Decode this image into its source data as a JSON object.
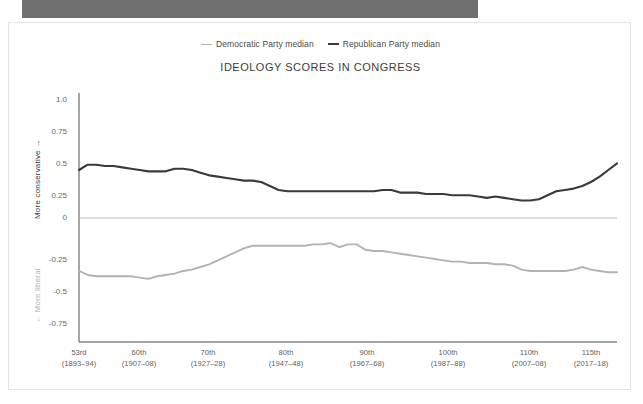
{
  "window": {
    "banner_name": "top-gray-banner"
  },
  "legend": {
    "position": "top-center",
    "items": [
      {
        "label": "Democratic Party median",
        "color": "#b3b3b3",
        "marker": "line-dash-light"
      },
      {
        "label": "Republican Party median",
        "color": "#3a3a3a",
        "marker": "line-dash-dark"
      }
    ]
  },
  "chart_data": {
    "type": "line",
    "title": "IDEOLOGY SCORES IN CONGRESS",
    "xlabel": "",
    "ylabel": "",
    "ylim": [
      -0.875,
      1.0
    ],
    "yticks": [
      "1.0",
      "0.75",
      "0.5",
      "0.25",
      "0",
      "-0.25",
      "-0.5",
      "-0.75"
    ],
    "ytick_values": [
      1.0,
      0.75,
      0.5,
      0.25,
      0,
      -0.25,
      -0.5,
      -0.75
    ],
    "y_axis_top_label": "More conservative →",
    "y_axis_bottom_label": "← More liberal",
    "grid": false,
    "zero_line": true,
    "legend_position": "top-center",
    "xtick_labels": [
      {
        "congress": "53rd",
        "years": "(1893–94)"
      },
      {
        "congress": "60th",
        "years": "(1907–08)"
      },
      {
        "congress": "70th",
        "years": "(1927–28)"
      },
      {
        "congress": "80th",
        "years": "(1947–48)"
      },
      {
        "congress": "90th",
        "years": "(1967–68)"
      },
      {
        "congress": "100th",
        "years": "(1987–88)"
      },
      {
        "congress": "110th",
        "years": "(2007–08)"
      },
      {
        "congress": "115th",
        "years": "(2017–18)"
      }
    ],
    "x": [
      53,
      54,
      55,
      56,
      57,
      58,
      59,
      60,
      61,
      62,
      63,
      64,
      65,
      66,
      67,
      68,
      69,
      70,
      71,
      72,
      73,
      74,
      75,
      76,
      77,
      78,
      79,
      80,
      81,
      82,
      83,
      84,
      85,
      86,
      87,
      88,
      89,
      90,
      91,
      92,
      93,
      94,
      95,
      96,
      97,
      98,
      99,
      100,
      101,
      102,
      103,
      104,
      105,
      106,
      107,
      108,
      109,
      110,
      111,
      112,
      113,
      114,
      115
    ],
    "xlim": [
      53,
      115
    ],
    "series": [
      {
        "name": "Republican Party median",
        "color": "#3a3a3a",
        "values": [
          0.42,
          0.46,
          0.46,
          0.45,
          0.45,
          0.44,
          0.43,
          0.42,
          0.41,
          0.41,
          0.41,
          0.43,
          0.43,
          0.42,
          0.4,
          0.38,
          0.37,
          0.36,
          0.35,
          0.34,
          0.34,
          0.33,
          0.3,
          0.27,
          0.26,
          0.26,
          0.26,
          0.26,
          0.26,
          0.26,
          0.26,
          0.26,
          0.26,
          0.26,
          0.26,
          0.27,
          0.27,
          0.25,
          0.25,
          0.25,
          0.24,
          0.24,
          0.24,
          0.23,
          0.23,
          0.23,
          0.22,
          0.21,
          0.22,
          0.21,
          0.2,
          0.19,
          0.19,
          0.2,
          0.23,
          0.26,
          0.27,
          0.28,
          0.3,
          0.33,
          0.37,
          0.42,
          0.47
        ]
      },
      {
        "name": "Democratic Party median",
        "color": "#b3b3b3",
        "values": [
          -0.34,
          -0.37,
          -0.38,
          -0.38,
          -0.38,
          -0.38,
          -0.38,
          -0.39,
          -0.4,
          -0.38,
          -0.37,
          -0.36,
          -0.34,
          -0.33,
          -0.31,
          -0.29,
          -0.26,
          -0.23,
          -0.2,
          -0.17,
          -0.15,
          -0.15,
          -0.15,
          -0.15,
          -0.15,
          -0.15,
          -0.15,
          -0.14,
          -0.14,
          -0.13,
          -0.16,
          -0.14,
          -0.14,
          -0.18,
          -0.19,
          -0.19,
          -0.2,
          -0.21,
          -0.22,
          -0.23,
          -0.24,
          -0.25,
          -0.26,
          -0.27,
          -0.27,
          -0.28,
          -0.28,
          -0.28,
          -0.29,
          -0.29,
          -0.3,
          -0.33,
          -0.34,
          -0.34,
          -0.34,
          -0.34,
          -0.34,
          -0.33,
          -0.31,
          -0.33,
          -0.34,
          -0.35,
          -0.35
        ]
      }
    ],
    "annotations": [
      {
        "text": "Republican peak near 110th–113th Congress",
        "value": 0.62
      },
      {
        "text": "Republican minimum near 104th Congress",
        "value": 0.19
      }
    ]
  }
}
